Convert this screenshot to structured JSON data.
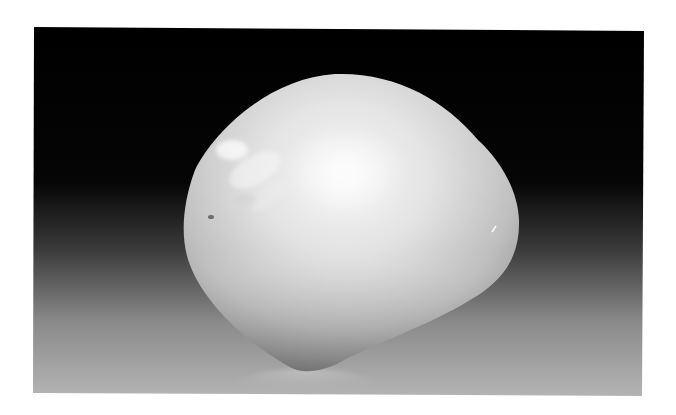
{
  "image": {
    "subject": "white pebble",
    "description": "Smooth rounded white stone photographed on a reflective surface against a black-to-light-gray gradient background, framed by a white border",
    "colors": {
      "border": "#ffffff",
      "background_top": "#000000",
      "background_bottom": "#b4b4b4",
      "pebble_highlight": "#f4f4f4",
      "pebble_mid": "#d6d6d6",
      "pebble_shadow": "#8c8c8c"
    }
  }
}
